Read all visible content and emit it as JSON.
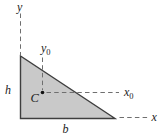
{
  "figure": {
    "type": "geometry-diagram",
    "labels": {
      "y_axis": "y",
      "x_axis": "x",
      "y0_base": "y",
      "y0_sub": "0",
      "x0_base": "x",
      "x0_sub": "0",
      "height": "h",
      "base": "b",
      "centroid": "C"
    },
    "colors": {
      "triangle_fill": "#c9c9c9",
      "triangle_stroke": "#3e3e3e",
      "dash_color": "#6f6f6f",
      "label_color": "#1c1c1c",
      "dot_color": "#111111",
      "background": "#ffffff"
    }
  }
}
